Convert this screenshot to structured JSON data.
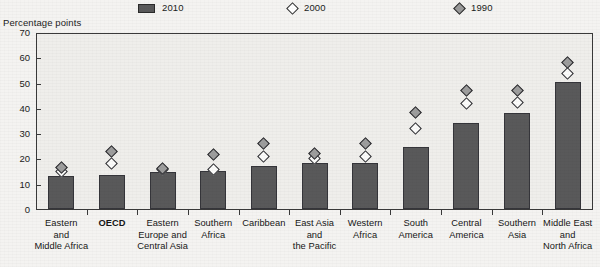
{
  "axis_unit_caption": "Percentage points",
  "legend": {
    "items": [
      {
        "label": "2010",
        "marker": "bar-swatch",
        "color": "#59595a",
        "x": 138
      },
      {
        "label": "2000",
        "marker": "open-diamond",
        "color": "#ffffff",
        "x": 288
      },
      {
        "label": "1990",
        "marker": "filled-diamond",
        "color": "#9a9a9a",
        "x": 455
      }
    ]
  },
  "y_axis": {
    "ticks": [
      "0",
      "10",
      "20",
      "30",
      "40",
      "50",
      "60",
      "70"
    ],
    "min": 0,
    "max": 70,
    "step": 10,
    "label": "Percentage points"
  },
  "chart_data": {
    "type": "bar",
    "title": "",
    "subtitle": "",
    "xlabel": "",
    "ylabel": "Percentage points",
    "ylim": [
      0,
      70
    ],
    "ytick_step": 10,
    "grid": false,
    "legend_position": "top",
    "categories": [
      "Eastern and Middle Africa",
      "OECD",
      "Eastern Europe and Central Asia",
      "Southern Africa",
      "Caribbean",
      "East Asia and the Pacific",
      "Western Africa",
      "South America",
      "Central America",
      "Southern Asia",
      "Middle East and North Africa"
    ],
    "category_lines": [
      [
        "Eastern",
        "and",
        "Middle Africa"
      ],
      [
        "OECD"
      ],
      [
        "Eastern",
        "Europe and",
        "Central Asia"
      ],
      [
        "Southern",
        "Africa"
      ],
      [
        "Caribbean"
      ],
      [
        "East Asia",
        "and",
        "the Pacific"
      ],
      [
        "Western",
        "Africa"
      ],
      [
        "South",
        "America"
      ],
      [
        "Central",
        "America"
      ],
      [
        "Southern",
        "Asia"
      ],
      [
        "Middle East",
        "and",
        "North Africa"
      ]
    ],
    "highlighted_category": "OECD",
    "series": [
      {
        "name": "2010",
        "type": "bar",
        "values": [
          13.4,
          14.0,
          15.0,
          15.5,
          17.4,
          18.5,
          18.6,
          24.8,
          34.6,
          38.2,
          50.6
        ]
      },
      {
        "name": "2000",
        "type": "marker",
        "marker": "open-diamond",
        "values": [
          15.4,
          18.2,
          16.0,
          16.0,
          21.0,
          20.5,
          21.0,
          32.2,
          42.0,
          42.6,
          54.0
        ]
      },
      {
        "name": "1990",
        "type": "marker",
        "marker": "filled-diamond",
        "values": [
          17.0,
          23.2,
          16.4,
          22.0,
          26.4,
          22.4,
          26.4,
          38.6,
          47.2,
          47.4,
          58.2
        ]
      }
    ]
  }
}
